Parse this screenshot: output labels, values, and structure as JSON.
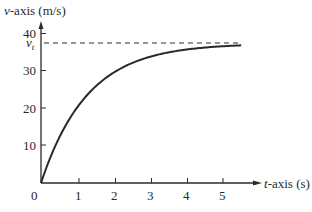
{
  "chart_data": {
    "type": "line",
    "title": "",
    "xlabel": "t-axis (s)",
    "ylabel": "v-axis (m/s)",
    "xlabel_var": "t",
    "xlabel_rest": "-axis (s)",
    "ylabel_var": "v",
    "ylabel_rest": "-axis (m/s)",
    "xlim": [
      0,
      5.5
    ],
    "ylim": [
      0,
      40
    ],
    "x_ticks": [
      1,
      2,
      3,
      4,
      5
    ],
    "x_tick_labels": [
      "1",
      "2",
      "3",
      "4",
      "5"
    ],
    "y_ticks": [
      10,
      20,
      30,
      40
    ],
    "y_tick_labels": [
      "10",
      "20",
      "30",
      "40"
    ],
    "origin_label": "0",
    "grid": false,
    "annotations": [
      {
        "text": "v_t",
        "type": "horizontal-dashed-asymptote",
        "y": 37.3,
        "label_main": "v",
        "label_sub": "t"
      }
    ],
    "series": [
      {
        "name": "v(t)",
        "x": [
          0,
          0.5,
          1,
          1.5,
          2,
          2.5,
          3,
          3.5,
          4,
          4.5,
          5,
          5.5
        ],
        "values": [
          0,
          11.4,
          20.3,
          25.8,
          29.7,
          32.4,
          33.9,
          35.0,
          35.6,
          36.2,
          36.5,
          36.9
        ]
      }
    ]
  }
}
